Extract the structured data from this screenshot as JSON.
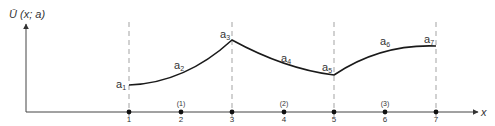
{
  "figure": {
    "y_axis_label": "Ū (x; a)",
    "x_axis_label": "x",
    "node_labels": [
      "1",
      "2",
      "3",
      "4",
      "5",
      "6",
      "7"
    ],
    "element_labels": [
      "(1)",
      "(2)",
      "(3)"
    ],
    "parameter_labels": [
      {
        "base": "a",
        "sub": "1"
      },
      {
        "base": "a",
        "sub": "2"
      },
      {
        "base": "a",
        "sub": "3"
      },
      {
        "base": "a",
        "sub": "4"
      },
      {
        "base": "a",
        "sub": "5"
      },
      {
        "base": "a",
        "sub": "6"
      },
      {
        "base": "a",
        "sub": "7"
      }
    ],
    "colors": {
      "curve": "#1a1a1a",
      "axis": "#444444",
      "dashed": "#999999",
      "text": "#333333"
    }
  }
}
